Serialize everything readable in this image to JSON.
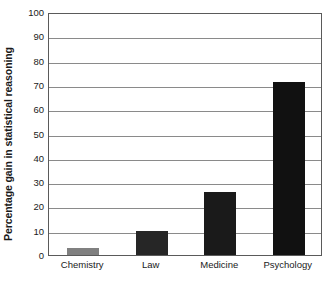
{
  "chart_data": {
    "type": "bar",
    "title": "",
    "xlabel": "",
    "ylabel": "Percentage gain in statistical reasoning",
    "categories": [
      "Chemistry",
      "Law",
      "Medicine",
      "Psychology"
    ],
    "values": [
      3,
      10,
      26,
      71
    ],
    "bar_colors": [
      "#808080",
      "#262626",
      "#1a1a1a",
      "#111111"
    ],
    "ylim": [
      0,
      100
    ],
    "ytick_labels": [
      "100",
      "90",
      "80",
      "70",
      "60",
      "50",
      "40",
      "30",
      "20",
      "10",
      "0"
    ],
    "ytick_values": [
      100,
      90,
      80,
      70,
      60,
      50,
      40,
      30,
      20,
      10,
      0
    ],
    "grid": "horizontal",
    "legend": "none",
    "frame_color": "#5a5a5a",
    "gridline_color": "#8a8a8a",
    "background_color": "#ffffff"
  }
}
